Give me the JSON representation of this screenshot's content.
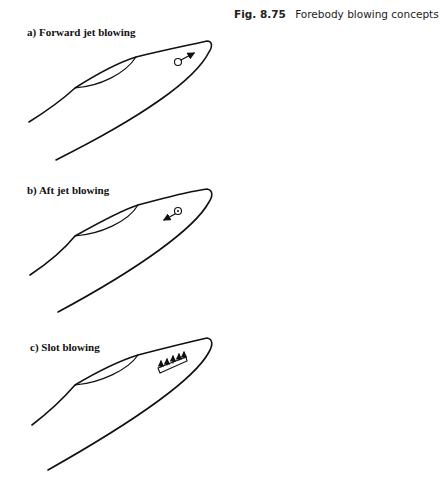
{
  "caption": {
    "figure_number": "Fig. 8.75",
    "title": "Forebody blowing concepts"
  },
  "panels": [
    {
      "id": "a",
      "label": "a) Forward jet blowing",
      "concept": "forward-jet",
      "jet_direction": "forward"
    },
    {
      "id": "b",
      "label": "b) Aft jet blowing",
      "concept": "aft-jet",
      "jet_direction": "aft"
    },
    {
      "id": "c",
      "label": "c) Slot blowing",
      "concept": "slot",
      "arrow_count": 5
    }
  ],
  "colors": {
    "stroke": "#111111",
    "background": "#ffffff"
  }
}
